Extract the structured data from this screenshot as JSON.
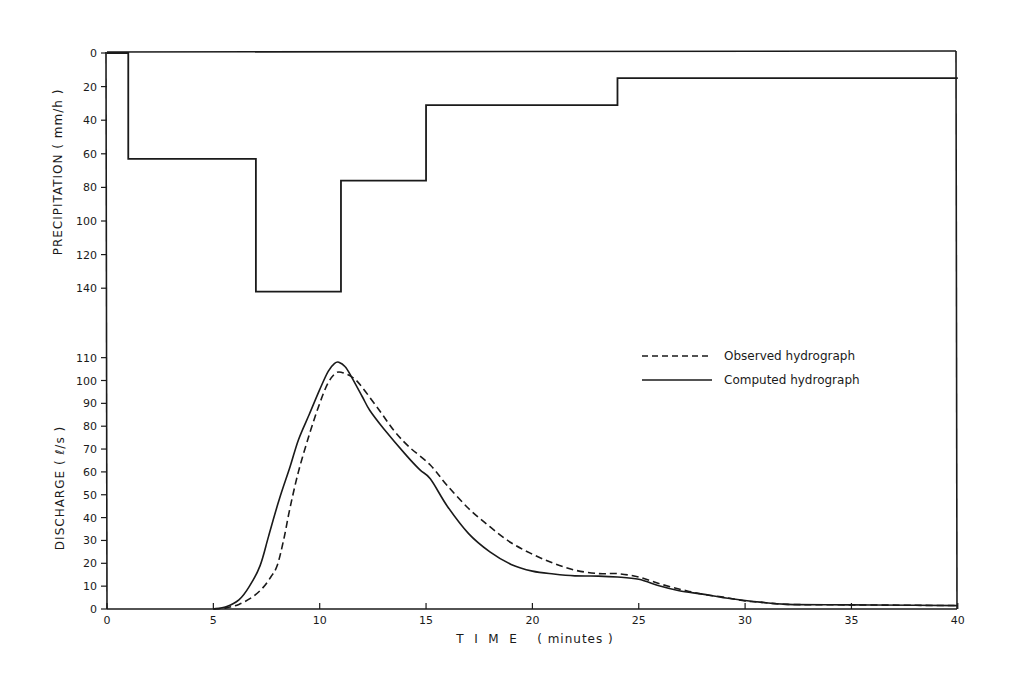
{
  "chart_data": [
    {
      "type": "line",
      "subtype": "step (inverted hyetograph)",
      "title": "",
      "xlabel": "",
      "ylabel": "PRECIPITATION ( mm/h )",
      "ylim": [
        0,
        140
      ],
      "y_inverted": true,
      "yticks": [
        0,
        20,
        40,
        60,
        80,
        100,
        120,
        140
      ],
      "xlim": [
        0,
        40
      ],
      "grid": false,
      "series": [
        {
          "name": "Precipitation intensity",
          "steps": [
            {
              "t_start": 0,
              "t_end": 1,
              "value": 0
            },
            {
              "t_start": 1,
              "t_end": 7,
              "value": 63
            },
            {
              "t_start": 7,
              "t_end": 11,
              "value": 142
            },
            {
              "t_start": 11,
              "t_end": 15,
              "value": 76
            },
            {
              "t_start": 15,
              "t_end": 24,
              "value": 31
            },
            {
              "t_start": 24,
              "t_end": 40,
              "value": 15
            }
          ]
        }
      ]
    },
    {
      "type": "line",
      "title": "",
      "xlabel": "T I M E  ( minutes )",
      "ylabel": "DISCHARGE  ( ℓ/s )",
      "xlim": [
        0,
        40
      ],
      "ylim": [
        0,
        110
      ],
      "xticks": [
        0,
        5,
        10,
        15,
        20,
        25,
        30,
        35,
        40
      ],
      "yticks": [
        0,
        10,
        20,
        30,
        40,
        50,
        60,
        70,
        80,
        90,
        100,
        110
      ],
      "grid": false,
      "legend_position": "upper right",
      "series": [
        {
          "name": "Observed hydrograph",
          "style": "dashed",
          "x": [
            5,
            5.6,
            6.2,
            6.8,
            7.3,
            7.7,
            8.0,
            8.3,
            8.6,
            9.0,
            9.5,
            10.0,
            10.4,
            10.8,
            11.2,
            11.6,
            12.0,
            12.8,
            13.5,
            14.2,
            15.2,
            16.0,
            17.0,
            18.0,
            19.0,
            20.0,
            21.0,
            22.0,
            23.1,
            24.0,
            25.0,
            26.0,
            27.0,
            28.0,
            29.1,
            30.0,
            30.7,
            32.0,
            35.0,
            38.0,
            40.0
          ],
          "y": [
            0,
            0.5,
            2,
            5,
            9,
            14,
            19,
            30,
            44,
            60,
            76,
            90,
            99,
            103.5,
            103,
            101,
            97,
            87,
            78,
            71,
            63,
            54,
            44,
            36,
            29,
            24,
            20,
            17,
            15.5,
            15.5,
            14,
            11,
            8.5,
            6.5,
            5,
            3.5,
            3,
            2,
            1.8,
            1.6,
            1.5
          ]
        },
        {
          "name": "Computed hydrograph",
          "style": "solid",
          "x": [
            5,
            5.6,
            6.2,
            6.7,
            7.2,
            7.6,
            8.1,
            8.6,
            9.0,
            9.5,
            10.0,
            10.4,
            10.7,
            10.9,
            11.2,
            11.5,
            12.0,
            12.35,
            13.0,
            14.0,
            14.7,
            15.2,
            16.0,
            17.0,
            18.0,
            19.0,
            20.0,
            21.0,
            22.0,
            23.1,
            24.0,
            25.0,
            26.0,
            26.9,
            28.0,
            29.1,
            30.0,
            30.7,
            32.0,
            35.0,
            38.0,
            40.0
          ],
          "y": [
            0,
            1,
            4,
            10,
            19,
            32,
            48,
            62,
            74,
            85,
            96,
            104,
            107.5,
            108,
            106,
            101.5,
            93,
            87,
            79,
            68,
            61,
            57,
            45,
            33,
            25,
            19.5,
            16.6,
            15.3,
            14.5,
            14.4,
            14,
            13,
            10,
            8,
            6.5,
            4.8,
            3.7,
            3,
            2,
            1.8,
            1.6,
            1.5
          ]
        }
      ],
      "legend": [
        "Observed hydrograph",
        "Computed hydrograph"
      ]
    }
  ],
  "labels": {
    "precip_axis_title": "PRECIPITATION ( mm/h )",
    "discharge_axis_title": "DISCHARGE   ( ℓ/s )",
    "time_axis_title": "T  I  M  E    ( minutes )",
    "legend_observed": "Observed hydrograph",
    "legend_computed": "Computed hydrograph"
  },
  "colors": {
    "ink": "#1a1a1a",
    "background": "#ffffff"
  }
}
